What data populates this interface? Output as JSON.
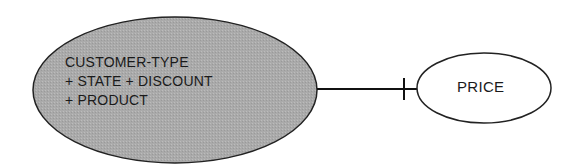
{
  "diagram": {
    "entities": [
      {
        "id": "composite-key",
        "lines": [
          "CUSTOMER-TYPE",
          "+ STATE + DISCOUNT",
          "+ PRODUCT"
        ],
        "fill": "#a9a9a9",
        "shaded": true
      },
      {
        "id": "price",
        "lines": [
          "PRICE"
        ],
        "fill": "#ffffff",
        "shaded": false
      }
    ],
    "relationships": [
      {
        "from": "composite-key",
        "to": "price",
        "end_marker_at_price": "one (bar)"
      }
    ]
  }
}
